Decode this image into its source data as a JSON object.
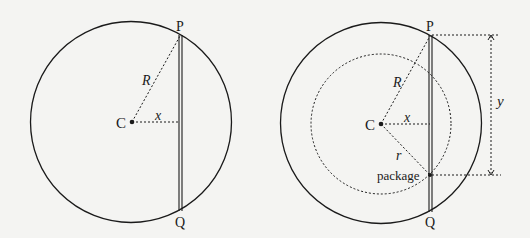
{
  "figure_left": {
    "labels": {
      "top_point": "P",
      "bottom_point": "Q",
      "center": "C",
      "radius": "R",
      "distance": "x"
    }
  },
  "figure_right": {
    "labels": {
      "top_point": "P",
      "bottom_point": "Q",
      "center": "C",
      "radius": "R",
      "distance": "x",
      "inner_radius": "r",
      "package": "package",
      "depth": "y"
    }
  },
  "colors": {
    "ink": "#1a1a1a",
    "background": "#f4f4f2"
  }
}
